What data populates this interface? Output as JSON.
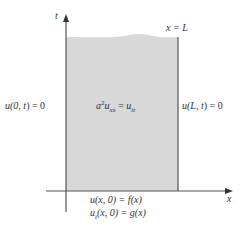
{
  "diagram": {
    "axes": {
      "t_label": "t",
      "x_label": "x"
    },
    "right_boundary_label": "x = L",
    "left_bc": {
      "pre": "u(0, ",
      "var": "t",
      "post": ") = 0"
    },
    "right_bc": {
      "pre": "u(",
      "L": "L",
      "mid": ", ",
      "var": "t",
      "post": ") = 0"
    },
    "pde": {
      "a": "a",
      "exp": "2",
      "u1": "u",
      "sub1": "xx",
      "eq": " = ",
      "u2": "u",
      "sub2": "tt"
    },
    "initial_conditions": [
      {
        "text_u": "u",
        "text_args": "(x, 0) = ",
        "text_f": "f",
        "text_fx": "(x)"
      },
      {
        "text_u": "u",
        "sub": "t",
        "text_args": "(x, 0) = ",
        "text_f": "g",
        "text_fx": "(x)"
      }
    ],
    "colors": {
      "region_fill": "#d8d8d8",
      "line": "#555555",
      "text": "#333333"
    }
  }
}
